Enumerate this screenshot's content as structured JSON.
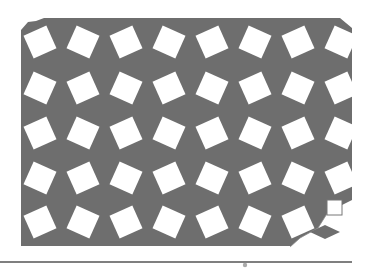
{
  "figure": {
    "colors": {
      "background": "#ffffff",
      "rhombus_fill": "#6e6e6e",
      "square_fill": "#ffffff",
      "rule": "#555555"
    },
    "grid": {
      "columns_x": [
        40,
        83,
        126,
        169,
        212,
        255,
        298,
        341
      ],
      "rows_y": [
        42,
        88,
        133,
        178,
        222
      ],
      "square_side": 25,
      "rotation_deg": 24
    },
    "region": {
      "left": 21,
      "top": 18,
      "right": 352,
      "bottom": 246
    },
    "legend": {
      "square": {
        "x": 327,
        "y": 200,
        "size": 15
      },
      "rhombus": {
        "cx": 325,
        "cy": 232,
        "w": 30,
        "h": 14
      }
    },
    "rule": {
      "y": 262,
      "x1": 0,
      "x2": 352
    }
  }
}
